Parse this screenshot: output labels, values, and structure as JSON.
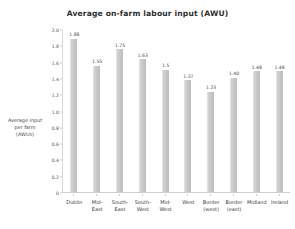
{
  "chart_data": {
    "type": "bar",
    "title": "Average on-farm labour input (AWU)",
    "xlabel": "",
    "ylabel": "Average input per farm (AWUs)",
    "ylabel_lines": [
      "Average input",
      "per farm",
      "(AWUs)"
    ],
    "ylim": [
      0,
      2.0
    ],
    "grid": false,
    "legend": "none",
    "yticks": [
      "2.0",
      "1.8",
      "1.6",
      "1.4",
      "1.2",
      "1.0",
      "0.8",
      "0.6",
      "0.4",
      "0.2",
      "0"
    ],
    "ytick_values": [
      2.0,
      1.8,
      1.6,
      1.4,
      1.2,
      1.0,
      0.8,
      0.6,
      0.4,
      0.2,
      0
    ],
    "categories": [
      "Dublin",
      "Mid-East",
      "South-East",
      "South-West",
      "Mid-West",
      "West",
      "Border (west)",
      "Border (east)",
      "Midland",
      "Ireland"
    ],
    "category_lines": [
      [
        "Dublin"
      ],
      [
        "Mid-",
        "East"
      ],
      [
        "South-",
        "East"
      ],
      [
        "South-",
        "West"
      ],
      [
        "Mid-",
        "West"
      ],
      [
        "West"
      ],
      [
        "Border",
        "(west)"
      ],
      [
        "Border",
        "(east)"
      ],
      [
        "Midland"
      ],
      [
        "Ireland"
      ]
    ],
    "values": [
      1.88,
      1.55,
      1.75,
      1.63,
      1.5,
      1.37,
      1.23,
      1.4,
      1.48,
      1.48
    ],
    "value_labels": [
      "1.88",
      "1.55",
      "1.75",
      "1.63",
      "1.5",
      "1.37",
      "1.23",
      "1.40",
      "1.48",
      "1.48"
    ],
    "bar_color": "#c6c6c6",
    "axis_color": "#d0d0d0",
    "text_color": "#3d3d3d",
    "background": "#ffffff"
  }
}
